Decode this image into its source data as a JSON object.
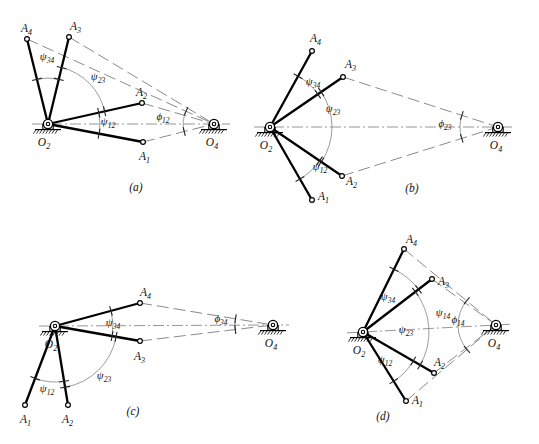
{
  "figure": {
    "type": "kinematic-synthesis-four-bar-diagram",
    "panel_captions": [
      "(a)",
      "(b)",
      "(c)",
      "(d)"
    ]
  },
  "labels": {
    "O2": "O",
    "O2_sub": "2",
    "O4": "O",
    "O4_sub": "4",
    "A1": "A",
    "A1_sub": "1",
    "A2": "A",
    "A2_sub": "2",
    "A3": "A",
    "A3_sub": "3",
    "A4": "A",
    "A4_sub": "4",
    "psi": "ψ",
    "phi": "ϕ",
    "sub12": "12",
    "sub23": "23",
    "sub34": "34",
    "sub14": "14"
  },
  "panels": [
    {
      "id": "a",
      "caption": "(a)",
      "caption_pos": [
        136,
        191
      ],
      "O2": [
        48,
        124
      ],
      "O4": [
        214,
        124
      ],
      "points": [
        {
          "name": "A1",
          "pos": [
            143,
            142
          ],
          "label_pos": [
            139,
            160
          ],
          "crank": true
        },
        {
          "name": "A2",
          "pos": [
            142,
            103
          ],
          "label_pos": [
            136,
            96
          ],
          "crank": true
        },
        {
          "name": "A3",
          "pos": [
            69,
            37
          ],
          "label_pos": [
            70,
            30
          ],
          "crank": true
        },
        {
          "name": "A4",
          "pos": [
            27,
            39
          ],
          "label_pos": [
            21,
            32
          ],
          "crank": true
        }
      ],
      "couplers": [
        {
          "from": "A1",
          "to": "O4"
        },
        {
          "from": "A2",
          "to": "O4"
        },
        {
          "from": "A3",
          "to": "O4"
        },
        {
          "from": "A4",
          "to": "O4"
        }
      ],
      "angle_labels": [
        {
          "text": "psi",
          "sub": "12",
          "pos": [
            108,
            125
          ]
        },
        {
          "text": "psi",
          "sub": "23",
          "pos": [
            98,
            80
          ]
        },
        {
          "text": "psi",
          "sub": "34",
          "pos": [
            47,
            60
          ]
        },
        {
          "text": "phi",
          "sub": "12",
          "pos": [
            163,
            120
          ]
        }
      ]
    },
    {
      "id": "b",
      "caption": "(b)",
      "caption_pos": [
        412,
        192
      ],
      "O2": [
        270,
        127
      ],
      "O4": [
        498,
        127
      ],
      "points": [
        {
          "name": "A1",
          "pos": [
            312,
            200
          ],
          "label_pos": [
            318,
            200
          ],
          "crank": true
        },
        {
          "name": "A2",
          "pos": [
            342,
            176
          ],
          "label_pos": [
            346,
            185
          ],
          "crank": true
        },
        {
          "name": "A3",
          "pos": [
            343,
            77
          ],
          "label_pos": [
            345,
            68
          ],
          "crank": true
        },
        {
          "name": "A4",
          "pos": [
            312,
            51
          ],
          "label_pos": [
            310,
            42
          ],
          "crank": true
        }
      ],
      "couplers": [
        {
          "from": "A2",
          "to": "O4"
        },
        {
          "from": "A3",
          "to": "O4"
        }
      ],
      "angle_labels": [
        {
          "text": "psi",
          "sub": "34",
          "pos": [
            313,
            85
          ]
        },
        {
          "text": "psi",
          "sub": "23",
          "pos": [
            333,
            112
          ]
        },
        {
          "text": "psi",
          "sub": "12",
          "pos": [
            320,
            170
          ]
        },
        {
          "text": "phi",
          "sub": "23",
          "pos": [
            445,
            127
          ]
        }
      ]
    },
    {
      "id": "c",
      "caption": "(c)",
      "caption_pos": [
        133,
        415
      ],
      "O2": [
        55,
        326
      ],
      "O4": [
        273,
        325
      ],
      "points": [
        {
          "name": "A1",
          "pos": [
            25,
            405
          ],
          "label_pos": [
            20,
            423
          ],
          "crank": true
        },
        {
          "name": "A2",
          "pos": [
            68,
            405
          ],
          "label_pos": [
            62,
            423
          ],
          "crank": true
        },
        {
          "name": "A3",
          "pos": [
            140,
            341
          ],
          "label_pos": [
            134,
            360
          ],
          "crank": true
        },
        {
          "name": "A4",
          "pos": [
            140,
            303
          ],
          "label_pos": [
            140,
            296
          ],
          "crank": true
        }
      ],
      "couplers": [
        {
          "from": "A3",
          "to": "O4"
        },
        {
          "from": "A4",
          "to": "O4"
        }
      ],
      "angle_labels": [
        {
          "text": "psi",
          "sub": "12",
          "pos": [
            47,
            392
          ]
        },
        {
          "text": "psi",
          "sub": "23",
          "pos": [
            104,
            379
          ]
        },
        {
          "text": "psi",
          "sub": "34",
          "pos": [
            113,
            326
          ]
        },
        {
          "text": "phi",
          "sub": "34",
          "pos": [
            221,
            322
          ]
        }
      ]
    },
    {
      "id": "d",
      "caption": "(d)",
      "caption_pos": [
        383,
        420
      ],
      "O2": [
        363,
        332
      ],
      "O4": [
        496,
        325
      ],
      "points": [
        {
          "name": "A1",
          "pos": [
            406,
            401
          ],
          "label_pos": [
            412,
            404
          ],
          "crank": true
        },
        {
          "name": "A2",
          "pos": [
            434,
            373
          ],
          "label_pos": [
            434,
            366
          ],
          "crank": true
        },
        {
          "name": "A3",
          "pos": [
            432,
            279
          ],
          "label_pos": [
            438,
            285
          ],
          "crank": true
        },
        {
          "name": "A4",
          "pos": [
            404,
            249
          ],
          "label_pos": [
            406,
            243
          ],
          "crank": true
        }
      ],
      "couplers": [
        {
          "from": "A1",
          "to": "O4"
        },
        {
          "from": "A2",
          "to": "O4"
        },
        {
          "from": "A3",
          "to": "O4"
        },
        {
          "from": "A4",
          "to": "O4"
        }
      ],
      "angle_labels": [
        {
          "text": "psi",
          "sub": "34",
          "pos": [
            388,
            300
          ]
        },
        {
          "text": "psi",
          "sub": "23",
          "pos": [
            406,
            333
          ]
        },
        {
          "text": "psi",
          "sub": "14",
          "pos": [
            443,
            316
          ]
        },
        {
          "text": "psi",
          "sub": "12",
          "pos": [
            385,
            363
          ]
        },
        {
          "text": "phi",
          "sub": "14",
          "pos": [
            458,
            323
          ]
        }
      ]
    }
  ],
  "colors": {
    "link": "#000000",
    "coupler": "#8a8a8a",
    "ground": "#000000",
    "centerline": "#8a8a8a",
    "arc": "#8a8a8a",
    "text": "#111111"
  }
}
